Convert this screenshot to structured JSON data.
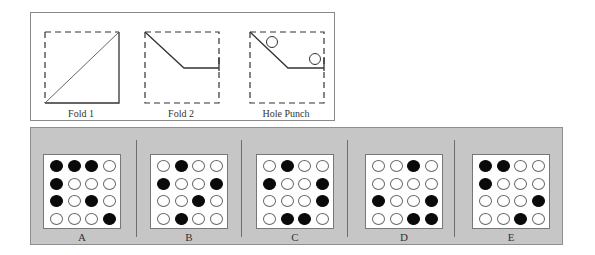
{
  "question": {
    "steps": [
      {
        "label": "Fold 1",
        "icon": "fold-diagonal-icon"
      },
      {
        "label": "Fold 2",
        "icon": "fold-corner-icon"
      },
      {
        "label": "Hole Punch",
        "icon": "hole-punch-icon"
      }
    ]
  },
  "options": [
    {
      "label": "A",
      "grid": [
        [
          1,
          1,
          1,
          0
        ],
        [
          1,
          0,
          0,
          0
        ],
        [
          1,
          0,
          1,
          0
        ],
        [
          0,
          0,
          0,
          1
        ]
      ]
    },
    {
      "label": "B",
      "grid": [
        [
          0,
          1,
          0,
          0
        ],
        [
          1,
          0,
          0,
          1
        ],
        [
          0,
          0,
          1,
          0
        ],
        [
          0,
          1,
          0,
          0
        ]
      ]
    },
    {
      "label": "C",
      "grid": [
        [
          0,
          1,
          0,
          0
        ],
        [
          1,
          0,
          0,
          1
        ],
        [
          0,
          0,
          0,
          1
        ],
        [
          0,
          1,
          1,
          0
        ]
      ]
    },
    {
      "label": "D",
      "grid": [
        [
          0,
          0,
          1,
          0
        ],
        [
          0,
          0,
          0,
          0
        ],
        [
          1,
          0,
          0,
          1
        ],
        [
          0,
          0,
          1,
          1
        ]
      ]
    },
    {
      "label": "E",
      "grid": [
        [
          1,
          1,
          0,
          0
        ],
        [
          1,
          0,
          0,
          0
        ],
        [
          0,
          0,
          0,
          1
        ],
        [
          0,
          0,
          1,
          0
        ]
      ]
    }
  ],
  "colors": {
    "options_background": "#c6c6c6",
    "hole_filled": "#0a0a0a",
    "hole_empty": "#ffffff"
  }
}
